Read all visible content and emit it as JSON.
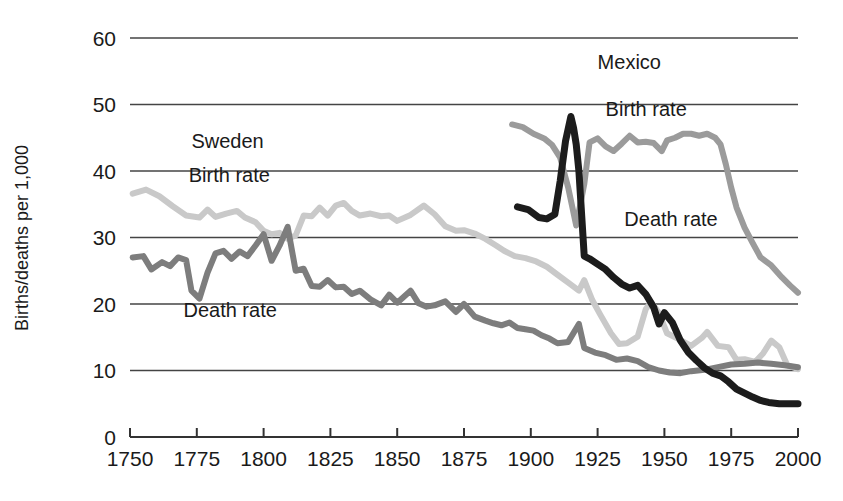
{
  "chart_data": {
    "type": "line",
    "title": "",
    "xlabel": "",
    "ylabel": "Births/deaths per 1,000",
    "xlim": [
      1750,
      2000
    ],
    "ylim": [
      0,
      60
    ],
    "grid": true,
    "legend_position": "inline-annotations",
    "x_ticks": [
      "1750",
      "1775",
      "1800",
      "1825",
      "1850",
      "1875",
      "1900",
      "1925",
      "1950",
      "1975",
      "2000"
    ],
    "y_ticks": [
      "0",
      "10",
      "20",
      "30",
      "40",
      "50",
      "60"
    ],
    "annotations": [
      {
        "text": "Sweden",
        "x": 1773,
        "y": 43.5
      },
      {
        "text": "Birth rate",
        "x": 1772,
        "y": 38.3
      },
      {
        "text": "Death rate",
        "x": 1770,
        "y": 18.0
      },
      {
        "text": "Mexico",
        "x": 1925,
        "y": 55.3
      },
      {
        "text": "Birth rate",
        "x": 1928,
        "y": 48.2
      },
      {
        "text": "Death rate",
        "x": 1935,
        "y": 31.8
      }
    ],
    "series": [
      {
        "name": "Sweden birth rate",
        "color": "#c9c9c9",
        "width": 6,
        "points": [
          [
            1751,
            36.6
          ],
          [
            1756,
            37.2
          ],
          [
            1761,
            36.2
          ],
          [
            1766,
            34.7
          ],
          [
            1771,
            33.3
          ],
          [
            1776,
            33.0
          ],
          [
            1779,
            34.2
          ],
          [
            1782,
            33.1
          ],
          [
            1786,
            33.6
          ],
          [
            1790,
            34.0
          ],
          [
            1793,
            33.0
          ],
          [
            1797,
            32.3
          ],
          [
            1800,
            31.0
          ],
          [
            1803,
            30.5
          ],
          [
            1806,
            30.7
          ],
          [
            1809,
            29.8
          ],
          [
            1812,
            30.3
          ],
          [
            1815,
            33.3
          ],
          [
            1818,
            33.2
          ],
          [
            1821,
            34.5
          ],
          [
            1824,
            33.3
          ],
          [
            1827,
            34.8
          ],
          [
            1830,
            35.2
          ],
          [
            1833,
            34.0
          ],
          [
            1836,
            33.3
          ],
          [
            1840,
            33.6
          ],
          [
            1844,
            33.2
          ],
          [
            1847,
            33.3
          ],
          [
            1850,
            32.5
          ],
          [
            1855,
            33.4
          ],
          [
            1860,
            34.8
          ],
          [
            1864,
            33.5
          ],
          [
            1868,
            31.7
          ],
          [
            1872,
            31.0
          ],
          [
            1875,
            31.1
          ],
          [
            1879,
            30.6
          ],
          [
            1883,
            29.8
          ],
          [
            1887,
            28.8
          ],
          [
            1890,
            28.0
          ],
          [
            1894,
            27.2
          ],
          [
            1898,
            26.9
          ],
          [
            1902,
            26.4
          ],
          [
            1906,
            25.6
          ],
          [
            1910,
            24.4
          ],
          [
            1914,
            23.2
          ],
          [
            1918,
            22.0
          ],
          [
            1920,
            23.6
          ],
          [
            1923,
            20.6
          ],
          [
            1926,
            18.4
          ],
          [
            1930,
            15.6
          ],
          [
            1933,
            14.0
          ],
          [
            1936,
            14.1
          ],
          [
            1940,
            15.1
          ],
          [
            1943,
            19.2
          ],
          [
            1945,
            20.3
          ],
          [
            1948,
            18.6
          ],
          [
            1951,
            15.6
          ],
          [
            1955,
            14.8
          ],
          [
            1960,
            13.7
          ],
          [
            1964,
            14.9
          ],
          [
            1966,
            15.8
          ],
          [
            1970,
            13.7
          ],
          [
            1974,
            13.5
          ],
          [
            1977,
            11.6
          ],
          [
            1980,
            11.7
          ],
          [
            1984,
            11.3
          ],
          [
            1987,
            12.6
          ],
          [
            1990,
            14.5
          ],
          [
            1993,
            13.5
          ],
          [
            1996,
            10.8
          ],
          [
            2000,
            10.2
          ]
        ]
      },
      {
        "name": "Sweden death rate",
        "color": "#7d7d7d",
        "width": 6,
        "points": [
          [
            1751,
            27.0
          ],
          [
            1755,
            27.2
          ],
          [
            1758,
            25.2
          ],
          [
            1762,
            26.3
          ],
          [
            1765,
            25.7
          ],
          [
            1768,
            27.0
          ],
          [
            1771,
            26.6
          ],
          [
            1773,
            22.0
          ],
          [
            1776,
            20.8
          ],
          [
            1779,
            24.7
          ],
          [
            1782,
            27.6
          ],
          [
            1785,
            28.0
          ],
          [
            1788,
            26.8
          ],
          [
            1791,
            27.9
          ],
          [
            1794,
            27.2
          ],
          [
            1797,
            28.8
          ],
          [
            1800,
            30.5
          ],
          [
            1803,
            26.5
          ],
          [
            1806,
            28.8
          ],
          [
            1809,
            31.6
          ],
          [
            1812,
            25.0
          ],
          [
            1815,
            25.3
          ],
          [
            1818,
            22.7
          ],
          [
            1821,
            22.6
          ],
          [
            1824,
            23.6
          ],
          [
            1827,
            22.5
          ],
          [
            1830,
            22.6
          ],
          [
            1833,
            21.5
          ],
          [
            1836,
            22.0
          ],
          [
            1840,
            20.7
          ],
          [
            1844,
            19.8
          ],
          [
            1847,
            21.4
          ],
          [
            1850,
            20.2
          ],
          [
            1855,
            22.0
          ],
          [
            1858,
            20.1
          ],
          [
            1861,
            19.6
          ],
          [
            1864,
            19.8
          ],
          [
            1868,
            20.4
          ],
          [
            1872,
            18.8
          ],
          [
            1875,
            20.0
          ],
          [
            1879,
            18.1
          ],
          [
            1883,
            17.5
          ],
          [
            1886,
            17.1
          ],
          [
            1889,
            16.8
          ],
          [
            1892,
            17.2
          ],
          [
            1895,
            16.4
          ],
          [
            1898,
            16.2
          ],
          [
            1901,
            16.0
          ],
          [
            1904,
            15.3
          ],
          [
            1907,
            14.8
          ],
          [
            1910,
            14.1
          ],
          [
            1914,
            14.3
          ],
          [
            1918,
            17.0
          ],
          [
            1920,
            13.4
          ],
          [
            1924,
            12.7
          ],
          [
            1928,
            12.3
          ],
          [
            1932,
            11.6
          ],
          [
            1936,
            11.8
          ],
          [
            1940,
            11.4
          ],
          [
            1944,
            10.5
          ],
          [
            1948,
            10.0
          ],
          [
            1952,
            9.7
          ],
          [
            1956,
            9.6
          ],
          [
            1960,
            9.9
          ],
          [
            1965,
            10.1
          ],
          [
            1970,
            10.5
          ],
          [
            1975,
            10.9
          ],
          [
            1980,
            11.0
          ],
          [
            1985,
            11.2
          ],
          [
            1990,
            11.0
          ],
          [
            1995,
            10.8
          ],
          [
            2000,
            10.5
          ]
        ]
      },
      {
        "name": "Mexico birth rate",
        "color": "#9b9b9b",
        "width": 6,
        "points": [
          [
            1893,
            47.0
          ],
          [
            1897,
            46.6
          ],
          [
            1901,
            45.6
          ],
          [
            1905,
            44.9
          ],
          [
            1908,
            43.9
          ],
          [
            1911,
            42.0
          ],
          [
            1914,
            37.5
          ],
          [
            1917,
            31.8
          ],
          [
            1920,
            38.0
          ],
          [
            1922,
            44.3
          ],
          [
            1925,
            44.9
          ],
          [
            1928,
            43.7
          ],
          [
            1931,
            43.0
          ],
          [
            1934,
            44.1
          ],
          [
            1937,
            45.3
          ],
          [
            1940,
            44.3
          ],
          [
            1943,
            44.4
          ],
          [
            1946,
            44.2
          ],
          [
            1949,
            43.0
          ],
          [
            1951,
            44.6
          ],
          [
            1954,
            45.0
          ],
          [
            1957,
            45.6
          ],
          [
            1960,
            45.6
          ],
          [
            1963,
            45.3
          ],
          [
            1966,
            45.6
          ],
          [
            1969,
            45.0
          ],
          [
            1971,
            44.0
          ],
          [
            1973,
            41.0
          ],
          [
            1975,
            37.5
          ],
          [
            1977,
            34.5
          ],
          [
            1980,
            31.5
          ],
          [
            1983,
            29.2
          ],
          [
            1986,
            27.0
          ],
          [
            1990,
            25.8
          ],
          [
            1994,
            24.0
          ],
          [
            1997,
            22.8
          ],
          [
            2000,
            21.7
          ]
        ]
      },
      {
        "name": "Mexico death rate",
        "color": "#1c1c1c",
        "width": 7,
        "points": [
          [
            1895,
            34.6
          ],
          [
            1899,
            34.2
          ],
          [
            1903,
            33.0
          ],
          [
            1906,
            32.8
          ],
          [
            1909,
            33.5
          ],
          [
            1911,
            38.5
          ],
          [
            1913,
            44.5
          ],
          [
            1915,
            48.2
          ],
          [
            1916,
            46.5
          ],
          [
            1917,
            44.0
          ],
          [
            1918,
            40.0
          ],
          [
            1920,
            27.2
          ],
          [
            1922,
            26.8
          ],
          [
            1925,
            26.0
          ],
          [
            1928,
            25.2
          ],
          [
            1931,
            24.0
          ],
          [
            1934,
            23.0
          ],
          [
            1937,
            22.4
          ],
          [
            1940,
            22.8
          ],
          [
            1943,
            21.5
          ],
          [
            1946,
            19.5
          ],
          [
            1948,
            17.0
          ],
          [
            1950,
            18.7
          ],
          [
            1953,
            17.2
          ],
          [
            1956,
            14.5
          ],
          [
            1959,
            12.7
          ],
          [
            1962,
            11.5
          ],
          [
            1965,
            10.4
          ],
          [
            1968,
            9.6
          ],
          [
            1971,
            9.2
          ],
          [
            1974,
            8.3
          ],
          [
            1977,
            7.2
          ],
          [
            1980,
            6.6
          ],
          [
            1983,
            6.0
          ],
          [
            1986,
            5.5
          ],
          [
            1989,
            5.2
          ],
          [
            1993,
            5.0
          ],
          [
            1997,
            5.0
          ],
          [
            2000,
            5.0
          ]
        ]
      }
    ]
  }
}
